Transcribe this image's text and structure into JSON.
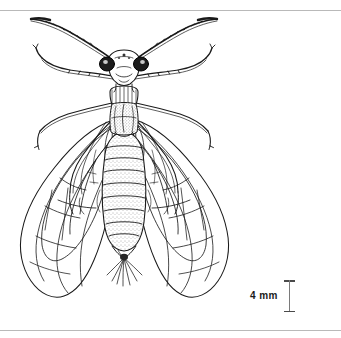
{
  "plate": {
    "background_color": "#ffffff",
    "ink_color": "#1a1a1a",
    "rule_color": "#b9b9b9",
    "subject": "winged insect, dorsal view",
    "illustration_name": "insect-dorsal-line-drawing",
    "top_rule_label": "top-divider",
    "bottom_rule_label": "bottom-divider"
  },
  "scale": {
    "label": "4 mm",
    "value": 4,
    "unit": "mm",
    "bar_color": "#4a4a4a",
    "orientation": "vertical"
  },
  "anatomy": {
    "head": "head",
    "eye_left": "left-compound-eye",
    "eye_right": "right-compound-eye",
    "antenna_left": "left-antenna",
    "antenna_right": "right-antenna",
    "thorax": "thorax",
    "abdomen": "abdomen",
    "forewing_left": "left-forewing",
    "forewing_right": "right-forewing",
    "hindwing_left": "left-hindwing",
    "hindwing_right": "right-hindwing",
    "legs": "legs",
    "cerci": "terminal-hairs"
  }
}
